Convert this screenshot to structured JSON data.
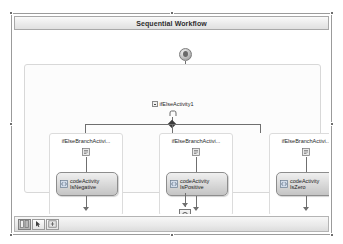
{
  "window": {
    "title": "Sequential Workflow"
  },
  "canvas": {
    "start_node": "start-node",
    "end_node": "end-node"
  },
  "workflow": {
    "root_activity": {
      "label": "ifElseActivity1",
      "icon": "ifelse-icon",
      "expander": "expander-collapse-icon"
    },
    "branches": [
      {
        "label": "ifElseBranchActivi...",
        "condition_icon": "branch-condition-icon",
        "activity": {
          "line1": "codeActivity",
          "line2": "IsNegative",
          "icon": "code-activity-icon"
        }
      },
      {
        "label": "ifElseBranchActivi...",
        "condition_icon": "branch-condition-icon",
        "activity": {
          "line1": "codeActivity",
          "line2": "IsPositive",
          "icon": "code-activity-icon"
        }
      },
      {
        "label": "ifElseBranchActivi...",
        "condition_icon": "branch-condition-icon",
        "activity": {
          "line1": "codeActivity",
          "line2": "IsZero",
          "icon": "code-activity-icon"
        }
      }
    ]
  },
  "status_bar": {
    "buttons": [
      {
        "name": "expand-all-button",
        "icon": "expand-all-icon"
      },
      {
        "name": "collapse-all-button",
        "icon": "pointer-icon"
      },
      {
        "name": "navigate-button",
        "icon": "pan-icon"
      }
    ]
  },
  "colors": {
    "frame_border": "#9b9b9b",
    "connector": "#6f6f6f",
    "title_text": "#2d2d2d",
    "activity_fill": "#dcdcdc",
    "handle": "#6e6e6e"
  }
}
